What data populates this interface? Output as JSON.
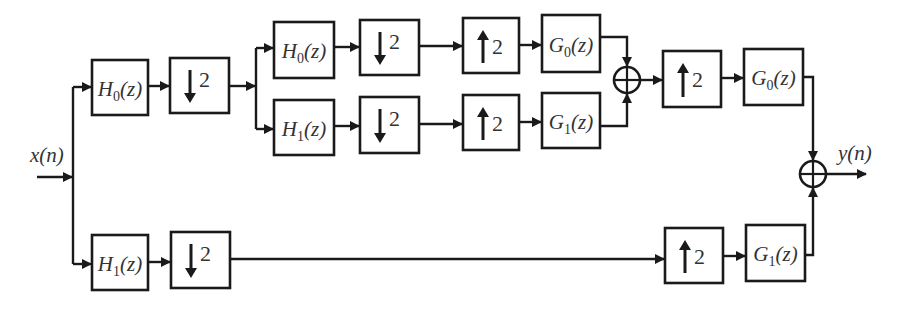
{
  "diagram": {
    "type": "block-diagram",
    "input_label": "x(n)",
    "output_label": "y(n)",
    "colors": {
      "stroke": "#1a1a1a",
      "text": "#333333",
      "background": "#ffffff"
    },
    "blocks": [
      {
        "id": "h0_l1",
        "kind": "filter",
        "name": "H",
        "sub": "0",
        "arg": "(z)",
        "x": 92,
        "y": 60,
        "w": 56,
        "h": 55
      },
      {
        "id": "dn_l1_top",
        "kind": "downsample",
        "factor": "2",
        "x": 170,
        "y": 58,
        "w": 59,
        "h": 55
      },
      {
        "id": "h0_l2",
        "kind": "filter",
        "name": "H",
        "sub": "0",
        "arg": "(z)",
        "x": 274,
        "y": 22,
        "w": 60,
        "h": 56
      },
      {
        "id": "dn_l2_a",
        "kind": "downsample",
        "factor": "2",
        "x": 360,
        "y": 20,
        "w": 59,
        "h": 55
      },
      {
        "id": "up_l2_a",
        "kind": "upsample",
        "factor": "2",
        "x": 463,
        "y": 18,
        "w": 56,
        "h": 55
      },
      {
        "id": "g0_l2",
        "kind": "filter",
        "name": "G",
        "sub": "0",
        "arg": "(z)",
        "x": 542,
        "y": 15,
        "w": 58,
        "h": 57
      },
      {
        "id": "h1_l2",
        "kind": "filter",
        "name": "H",
        "sub": "1",
        "arg": "(z)",
        "x": 274,
        "y": 100,
        "w": 60,
        "h": 55
      },
      {
        "id": "dn_l2_b",
        "kind": "downsample",
        "factor": "2",
        "x": 360,
        "y": 97,
        "w": 59,
        "h": 56
      },
      {
        "id": "up_l2_b",
        "kind": "upsample",
        "factor": "2",
        "x": 463,
        "y": 95,
        "w": 56,
        "h": 55
      },
      {
        "id": "g1_l2",
        "kind": "filter",
        "name": "G",
        "sub": "1",
        "arg": "(z)",
        "x": 542,
        "y": 93,
        "w": 58,
        "h": 55
      },
      {
        "id": "up_l1_top",
        "kind": "upsample",
        "factor": "2",
        "x": 663,
        "y": 51,
        "w": 58,
        "h": 56
      },
      {
        "id": "g0_l1",
        "kind": "filter",
        "name": "G",
        "sub": "0",
        "arg": "(z)",
        "x": 744,
        "y": 49,
        "w": 59,
        "h": 56
      },
      {
        "id": "h1_l1",
        "kind": "filter",
        "name": "H",
        "sub": "1",
        "arg": "(z)",
        "x": 92,
        "y": 235,
        "w": 56,
        "h": 55
      },
      {
        "id": "dn_l1_bot",
        "kind": "downsample",
        "factor": "2",
        "x": 171,
        "y": 232,
        "w": 59,
        "h": 56
      },
      {
        "id": "up_l1_bot",
        "kind": "upsample",
        "factor": "2",
        "x": 665,
        "y": 228,
        "w": 58,
        "h": 55
      },
      {
        "id": "g1_l1",
        "kind": "filter",
        "name": "G",
        "sub": "1",
        "arg": "(z)",
        "x": 746,
        "y": 225,
        "w": 59,
        "h": 56
      }
    ],
    "summers": [
      {
        "id": "sum_l2",
        "cx": 627,
        "cy": 80,
        "r": 13
      },
      {
        "id": "sum_out",
        "cx": 813,
        "cy": 174,
        "r": 13
      }
    ]
  }
}
